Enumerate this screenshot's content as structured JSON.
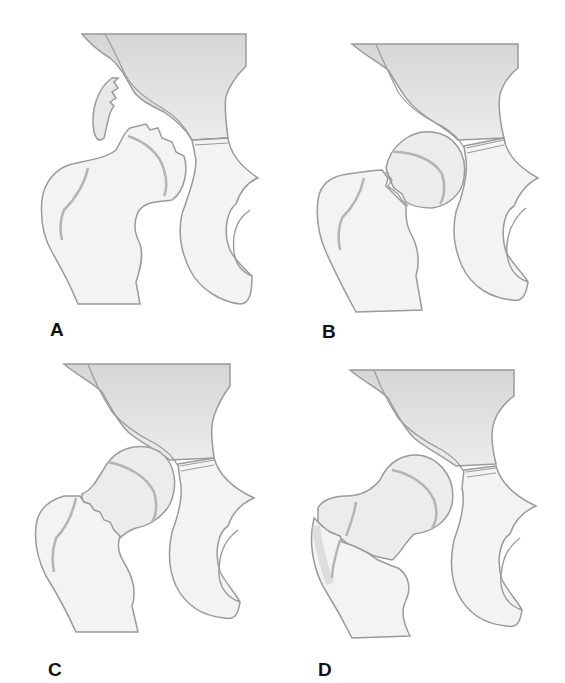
{
  "figure": {
    "panels": [
      {
        "id": "A",
        "label": "A",
        "fracture": "head fragment displaced (fragmented)"
      },
      {
        "id": "B",
        "label": "B",
        "fracture": "subcapital"
      },
      {
        "id": "C",
        "label": "C",
        "fracture": "transcervical"
      },
      {
        "id": "D",
        "label": "D",
        "fracture": "intertrochanteric"
      }
    ],
    "colors": {
      "outline": "#9a9a9a",
      "bone_fill": "#f3f3f3",
      "shade": "#dcdcdc",
      "label": "#111111",
      "background": "#ffffff"
    }
  }
}
